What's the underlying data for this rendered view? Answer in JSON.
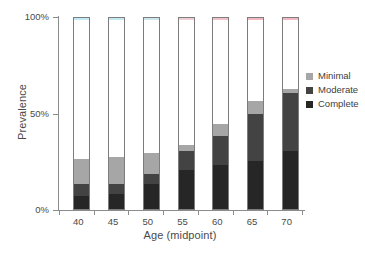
{
  "chart_data": {
    "type": "bar",
    "subtype": "stacked-bar-percent",
    "title": "",
    "xlabel": "Age (midpoint)",
    "ylabel": "Prevalence",
    "categories": [
      "40",
      "45",
      "50",
      "55",
      "60",
      "65",
      "70"
    ],
    "xtick_labels": [
      "40",
      "45",
      "50",
      "55",
      "60",
      "65",
      "70"
    ],
    "ytick_labels": [
      "0%",
      "50%",
      "100%"
    ],
    "ytick_values": [
      0,
      50,
      100
    ],
    "ylim": [
      0,
      100
    ],
    "grid": false,
    "legend_position": "right",
    "legend_entries": [
      "Minimal",
      "Moderate",
      "Complete"
    ],
    "stack_order_bottom_to_top": [
      "Complete",
      "Moderate",
      "Minimal"
    ],
    "series": [
      {
        "name": "Complete",
        "color": "#262626",
        "values": [
          7,
          8,
          13,
          20,
          23,
          25,
          30
        ]
      },
      {
        "name": "Moderate",
        "color": "#434343",
        "values": [
          6,
          5,
          5,
          10,
          15,
          24,
          30
        ]
      },
      {
        "name": "Minimal",
        "color": "#a6a6a6",
        "values": [
          13,
          14,
          11,
          3,
          6,
          7,
          2
        ]
      }
    ],
    "totals": [
      26,
      27,
      29,
      33,
      44,
      56,
      62
    ]
  },
  "axes": {
    "y": {
      "title": "Prevalence",
      "ticks": [
        {
          "label": "100%",
          "value": 100
        },
        {
          "label": "50%",
          "value": 50
        },
        {
          "label": "0%",
          "value": 0
        }
      ]
    },
    "x": {
      "title": "Age (midpoint)",
      "ticks": [
        {
          "label": "40"
        },
        {
          "label": "45"
        },
        {
          "label": "50"
        },
        {
          "label": "55"
        },
        {
          "label": "60"
        },
        {
          "label": "65"
        },
        {
          "label": "70"
        }
      ]
    }
  },
  "legend": {
    "items": [
      {
        "label": "Minimal",
        "color": "#a6a6a6"
      },
      {
        "label": "Moderate",
        "color": "#434343"
      },
      {
        "label": "Complete",
        "color": "#262626"
      }
    ]
  },
  "style": {
    "axis_color": "#8c8c8c",
    "text_color": "#4a4a4a",
    "bar_border": "#7d7d7d",
    "background": "#ffffff"
  }
}
